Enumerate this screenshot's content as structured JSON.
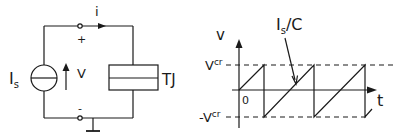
{
  "circuit": {
    "current_label": "i",
    "plus_label": "+",
    "minus_label": "-",
    "source_label_main": "I",
    "source_label_sub": "s",
    "voltage_label": "V",
    "junction_label": "TJ"
  },
  "graph": {
    "y_axis_label": "v",
    "x_axis_label": "t",
    "origin_label": "0",
    "upper_level_main": "V",
    "upper_level_sup": "cr",
    "lower_level_main": "-V",
    "lower_level_sup": "cr",
    "slope_label_main": "I",
    "slope_label_sub": "s",
    "slope_label_rest": "/C"
  },
  "colors": {
    "stroke": "#1a1a1a",
    "background": "#ffffff"
  }
}
